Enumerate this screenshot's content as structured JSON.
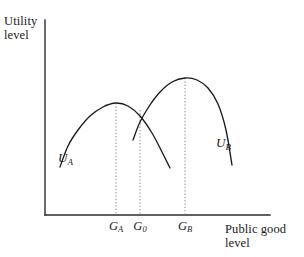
{
  "figure": {
    "background_color": "#ffffff",
    "ink_color": "#1a1a1a"
  },
  "axes": {
    "y_label_line1": "Utility",
    "y_label_line2": "level",
    "x_label_line1": "Public good",
    "x_label_line2": "level",
    "origin_x_px": 45,
    "origin_y_px": 215,
    "x_axis_end_px": 270,
    "y_axis_top_px": 20,
    "axis_color": "#2b2b2b"
  },
  "ticks": [
    {
      "name": "G_A",
      "symbol": "G",
      "subscript": "A",
      "x_px": 116
    },
    {
      "name": "G_0",
      "symbol": "G",
      "subscript": "0",
      "x_px": 140
    },
    {
      "name": "G_B",
      "symbol": "G",
      "subscript": "B",
      "x_px": 185
    }
  ],
  "curves": [
    {
      "name": "U_A",
      "symbol": "U",
      "subscript": "A",
      "label_x_px": 58,
      "label_y_px": 150,
      "peak_x_px": 116,
      "peak_y_px": 103,
      "start_x_px": 60,
      "start_y_px": 167,
      "end_x_px": 170,
      "end_y_px": 168,
      "stroke_color": "#1a1a1a"
    },
    {
      "name": "U_B",
      "symbol": "U",
      "subscript": "B",
      "label_x_px": 216,
      "label_y_px": 135,
      "peak_x_px": 185,
      "peak_y_px": 78,
      "start_x_px": 133,
      "start_y_px": 140,
      "end_x_px": 232,
      "end_y_px": 165,
      "stroke_color": "#1a1a1a"
    }
  ],
  "guide_lines": [
    {
      "name": "guide-GA",
      "x_px": 116,
      "top_y_px": 103,
      "bottom_y_px": 215
    },
    {
      "name": "guide-G0",
      "x_px": 140,
      "top_y_px": 110,
      "bottom_y_px": 215
    },
    {
      "name": "guide-GB",
      "x_px": 185,
      "top_y_px": 78,
      "bottom_y_px": 215
    }
  ],
  "chart_data": {
    "type": "line",
    "title": "",
    "xlabel": "Public good level",
    "ylabel": "Utility level",
    "grid": false,
    "legend": "inline-curve-labels",
    "xlim": [
      45,
      270
    ],
    "ylim": [
      215,
      20
    ],
    "xtick_labels": [
      "G_A",
      "G_0",
      "G_B"
    ],
    "xtick_positions_px": [
      116,
      140,
      185
    ],
    "ytick_labels": [],
    "annotations": [
      "U_A",
      "U_B"
    ],
    "series": [
      {
        "name": "U_A",
        "description": "Single-peaked utility curve for individual A, peaking at G_A",
        "x": [
          60,
          68,
          78,
          90,
          103,
          116,
          128,
          140,
          152,
          162,
          170
        ],
        "y": [
          167,
          146,
          130,
          116,
          107,
          103,
          106,
          116,
          133,
          152,
          168
        ]
      },
      {
        "name": "U_B",
        "description": "Single-peaked utility curve for individual B, peaking at G_B",
        "x": [
          133,
          140,
          150,
          160,
          172,
          185,
          197,
          208,
          218,
          226,
          232
        ],
        "y": [
          140,
          122,
          105,
          92,
          82,
          78,
          80,
          88,
          104,
          130,
          165
        ]
      }
    ]
  }
}
